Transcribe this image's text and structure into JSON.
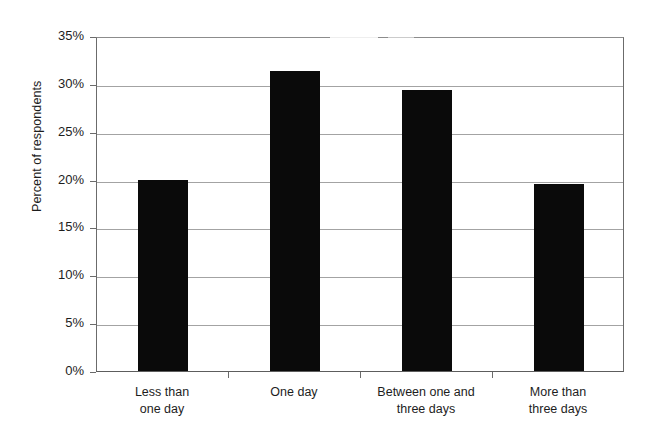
{
  "chart_data": {
    "type": "bar",
    "title": "",
    "subtitle": "",
    "xlabel": "",
    "ylabel": "Percent of respondents",
    "categories": [
      "Less than one day",
      "One day",
      "Between one and three days",
      "More than three days"
    ],
    "category_lines": [
      [
        "Less than",
        "one day"
      ],
      [
        "One day",
        ""
      ],
      [
        "Between one and",
        "three days"
      ],
      [
        "More than",
        "three days"
      ]
    ],
    "values": [
      20.0,
      31.3,
      29.4,
      19.5
    ],
    "value_labels": [
      "20%",
      "31.3%",
      "29.4%",
      "19.5%"
    ],
    "ylim": [
      0,
      35
    ],
    "ytick_values": [
      0,
      5,
      10,
      15,
      20,
      25,
      30,
      35
    ],
    "ytick_labels": [
      "0%",
      "5%",
      "10%",
      "15%",
      "20%",
      "25%",
      "30%",
      "35%"
    ],
    "grid": true,
    "grid_axis": "y",
    "legend": false,
    "legend_position": "none",
    "bar_color": "#0a0a0a",
    "gridline_color": "#a3a3a3",
    "axis_color": "#6b6b6b",
    "background_color": "#ffffff"
  }
}
